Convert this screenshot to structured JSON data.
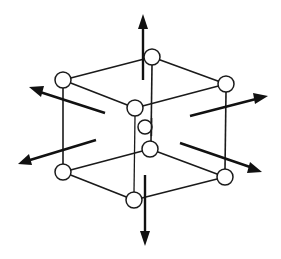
{
  "diagram": {
    "type": "crystal-lattice-cell",
    "colors": {
      "background": "#ffffff",
      "line": "#1a1a1a",
      "atom_fill": "#ffffff"
    },
    "atoms": [
      {
        "id": "top-back",
        "x": 152,
        "y": 57
      },
      {
        "id": "top-left",
        "x": 63,
        "y": 80
      },
      {
        "id": "top-right",
        "x": 226,
        "y": 84
      },
      {
        "id": "top-front",
        "x": 135,
        "y": 108
      },
      {
        "id": "center",
        "x": 145,
        "y": 127
      },
      {
        "id": "bottom-back",
        "x": 150,
        "y": 149
      },
      {
        "id": "bottom-left",
        "x": 63,
        "y": 172
      },
      {
        "id": "bottom-right",
        "x": 225,
        "y": 177
      },
      {
        "id": "bottom-front",
        "x": 134,
        "y": 200
      }
    ],
    "arrows": [
      {
        "id": "up",
        "direction": "up"
      },
      {
        "id": "down",
        "direction": "down"
      },
      {
        "id": "upper-left",
        "direction": "left-up"
      },
      {
        "id": "upper-right",
        "direction": "right-up"
      },
      {
        "id": "lower-left",
        "direction": "left-down"
      },
      {
        "id": "lower-right",
        "direction": "right-down"
      }
    ]
  }
}
